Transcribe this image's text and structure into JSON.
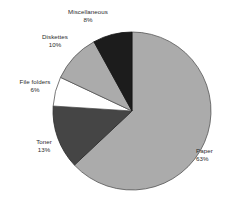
{
  "chart_data": {
    "type": "pie",
    "title": "",
    "subtitle": "",
    "xlabel": "",
    "ylabel": "",
    "grid": false,
    "legend": "none",
    "label_style": "outside name and percent",
    "start_angle_deg": 0,
    "direction": "clockwise",
    "total_percent": 100,
    "categories": [
      "Paper",
      "Toner",
      "File folders",
      "Diskettes",
      "Miscellaneous"
    ],
    "values": [
      63,
      13,
      6,
      10,
      8
    ],
    "slices": [
      {
        "name": "Paper",
        "percent_label": "63%",
        "value": 63,
        "color": "#ababab",
        "outline": "#555555"
      },
      {
        "name": "Toner",
        "percent_label": "13%",
        "value": 13,
        "color": "#454545",
        "outline": "#2a2a2a"
      },
      {
        "name": "File folders",
        "percent_label": "6%",
        "value": 6,
        "color": "#ffffff",
        "outline": "#555555"
      },
      {
        "name": "Diskettes",
        "percent_label": "10%",
        "value": 10,
        "color": "#ababab",
        "outline": "#555555"
      },
      {
        "name": "Miscellaneous",
        "percent_label": "8%",
        "value": 8,
        "color": "#1c1c1c",
        "outline": "#111111"
      }
    ]
  },
  "labels": {
    "paper": {
      "name": "Paper",
      "percent": "63%"
    },
    "toner": {
      "name": "Toner",
      "percent": "13%"
    },
    "file_folders": {
      "name": "File folders",
      "percent": "6%"
    },
    "diskettes": {
      "name": "Diskettes",
      "percent": "10%"
    },
    "miscellaneous": {
      "name": "Miscellaneous",
      "percent": "8%"
    }
  },
  "colors": {
    "background": "#ffffff",
    "text": "#2b2b2b",
    "slice_light_gray": "#ababab",
    "slice_dark_gray": "#454545",
    "slice_white": "#ffffff",
    "slice_black": "#1c1c1c"
  }
}
